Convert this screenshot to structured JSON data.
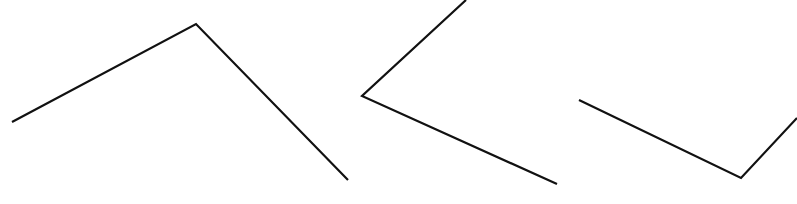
{
  "canvas": {
    "width": 797,
    "height": 204,
    "background": "#ffffff"
  },
  "style": {
    "stroke_color": "#111111",
    "stroke_width": 2.2
  },
  "shapes": [
    {
      "name": "angle-left",
      "description": "open angle, apex pointing up",
      "points": [
        [
          12,
          122
        ],
        [
          196,
          24
        ],
        [
          348,
          180
        ]
      ]
    },
    {
      "name": "angle-middle",
      "description": "open angle, apex pointing left",
      "points": [
        [
          466,
          0
        ],
        [
          362,
          96
        ],
        [
          557,
          184
        ]
      ]
    },
    {
      "name": "angle-right",
      "description": "open angle, apex pointing down",
      "points": [
        [
          579,
          100
        ],
        [
          741,
          178
        ],
        [
          797,
          118
        ]
      ]
    }
  ]
}
